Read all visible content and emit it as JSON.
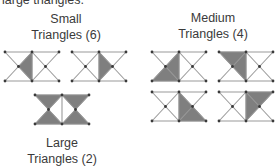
{
  "intro_text": "large triangles.",
  "groups": {
    "small": {
      "title": "Small",
      "subtitle": "Triangles (6)"
    },
    "medium": {
      "title": "Medium",
      "subtitle": "Triangles (4)"
    },
    "large": {
      "title": "Large",
      "subtitle": "Triangles (2)"
    }
  },
  "colors": {
    "shade": "#7f7f7f",
    "edge": "#9a9a9a",
    "vertex": "#3a3a3a"
  },
  "figures": [
    {
      "id": "small-1",
      "group": "small",
      "shaded": "left-center-small"
    },
    {
      "id": "small-2",
      "group": "small",
      "shaded": "right-center-small"
    },
    {
      "id": "medium-1",
      "group": "medium",
      "shaded": "left-half-lower-medium"
    },
    {
      "id": "medium-2",
      "group": "medium",
      "shaded": "left-half-upper-medium"
    },
    {
      "id": "medium-3",
      "group": "medium",
      "shaded": "right-half-lower-medium"
    },
    {
      "id": "medium-4",
      "group": "medium",
      "shaded": "right-half-upper-medium"
    },
    {
      "id": "large-1",
      "group": "large",
      "shaded": "both-bowties"
    }
  ]
}
